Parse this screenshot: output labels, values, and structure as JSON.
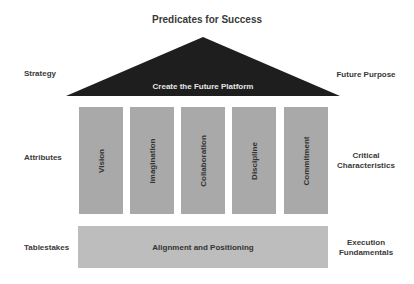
{
  "title": "Predicates for Success",
  "roof": {
    "label": "Create the Future Platform",
    "color": "#1e1e1e"
  },
  "pillars": [
    {
      "label": "Vision"
    },
    {
      "label": "Imagination"
    },
    {
      "label": "Collaboration"
    },
    {
      "label": "Discipline"
    },
    {
      "label": "Commitment"
    }
  ],
  "base": {
    "label": "Alignment and Positioning"
  },
  "left_labels": {
    "strategy": "Strategy",
    "attributes": "Attributes",
    "tablestakes": "Tablestakes"
  },
  "right_labels": {
    "future_purpose": "Future Purpose",
    "critical_1": "Critical",
    "critical_2": "Characteristics",
    "execution_1": "Execution",
    "execution_2": "Fundamentals"
  }
}
